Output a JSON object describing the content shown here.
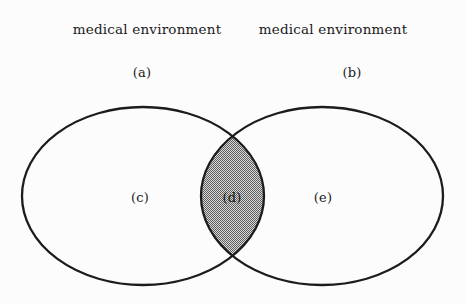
{
  "labels": {
    "left_title": "medical environment",
    "right_title": "medical environment",
    "a": "(a)",
    "b": "(b)",
    "c": "(c)",
    "d": "(d)",
    "e": "(e)"
  },
  "colors": {
    "outline": "#1c1c1c",
    "shade_dark": "#5e5e5e",
    "shade_light": "#d9d9d9",
    "background": "#fcfcfc",
    "text": "#1a1a1a"
  }
}
